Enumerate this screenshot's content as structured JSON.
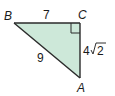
{
  "diagram": {
    "type": "right-triangle",
    "fill_color": "#cde8d9",
    "stroke_color": "#1a1a1a",
    "vertices": {
      "B": {
        "label": "B"
      },
      "C": {
        "label": "C"
      },
      "A": {
        "label": "A"
      }
    },
    "sides": {
      "BC": {
        "label": "7"
      },
      "BA": {
        "label": "9"
      },
      "CA": {
        "label_coef": "4",
        "label_radicand": "2"
      }
    },
    "right_angle_at": "C"
  }
}
